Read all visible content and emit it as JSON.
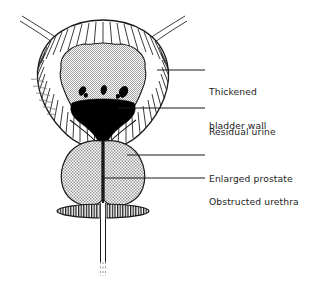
{
  "figure": {
    "name": "bladder-outflow-obstruction",
    "background_color": "#ffffff",
    "line_color": "#1a1a1a",
    "fill_urine_color": "#000000",
    "stipple_color": "#8a8a8a"
  },
  "labels": [
    {
      "id": "thickened-bladder-wall",
      "line1": "Thickened",
      "line2": "bladder wall",
      "leader_y": 70
    },
    {
      "id": "residual-urine",
      "line1": "Residual urine",
      "line2": "",
      "leader_y": 108
    },
    {
      "id": "enlarged-prostate",
      "line1": "Enlarged prostate",
      "line2": "",
      "leader_y": 155
    },
    {
      "id": "obstructed-urethra",
      "line1": "Obstructed urethra",
      "line2": "",
      "leader_y": 178
    }
  ],
  "structures": [
    {
      "id": "bladder-wall",
      "label": "Thickened bladder wall",
      "texture": "radial-hatching"
    },
    {
      "id": "bladder-lumen",
      "label": "Bladder lumen",
      "texture": "stipple"
    },
    {
      "id": "residual-urine-pool",
      "label": "Residual urine",
      "texture": "solid-black"
    },
    {
      "id": "left-ureter",
      "label": "Left ureter",
      "texture": "outline"
    },
    {
      "id": "right-ureter",
      "label": "Right ureter",
      "texture": "outline"
    },
    {
      "id": "prostate-left-lobe",
      "label": "Enlarged prostate left lobe",
      "texture": "stipple"
    },
    {
      "id": "prostate-right-lobe",
      "label": "Enlarged prostate right lobe",
      "texture": "stipple"
    },
    {
      "id": "urethra",
      "label": "Obstructed urethra",
      "texture": "outline"
    },
    {
      "id": "pelvic-floor",
      "label": "Pelvic floor muscle",
      "texture": "vertical-hatching"
    }
  ]
}
